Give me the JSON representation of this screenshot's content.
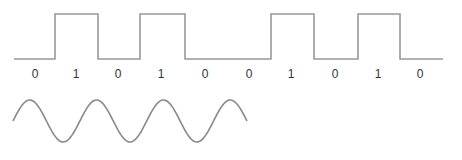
{
  "digital_signal": {
    "bits": [
      "0",
      "1",
      "0",
      "1",
      "0",
      "0",
      "1",
      "0",
      "1",
      "0"
    ],
    "bit_label_x": [
      35,
      76,
      118,
      161,
      205,
      249,
      291,
      335,
      378,
      420
    ],
    "low_y": 59,
    "high_y": 14,
    "path": "M 14 59 L 55 59 L 55 14 L 98 14 L 98 59 L 140 59 L 140 14 L 185 14 L 185 59 L 271 59 L 271 14 L 314 14 L 314 59 L 358 59 L 358 14 L 400 14 L 400 59 L 443 59",
    "stroke": "#999999"
  },
  "analog_signal": {
    "type": "sine",
    "x_start": 13,
    "x_end": 247,
    "center_y": 121,
    "amplitude": 21,
    "cycles": 3.5,
    "stroke": "#888888"
  }
}
